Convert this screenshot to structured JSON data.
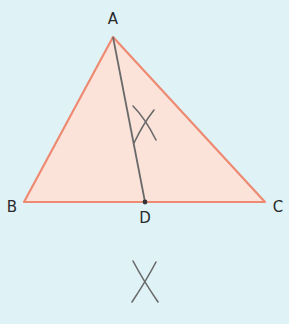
{
  "diagram": {
    "colors": {
      "background": "#dff3f7",
      "triangle_fill": "#fbe3da",
      "triangle_stroke": "#ee8a72",
      "construction": "#6a6a6a",
      "point": "#333333"
    },
    "points": {
      "A": {
        "label": "A",
        "x": 113,
        "y": 37
      },
      "B": {
        "label": "B",
        "x": 24,
        "y": 202
      },
      "C": {
        "label": "C",
        "x": 265,
        "y": 202
      },
      "D": {
        "label": "D",
        "x": 145,
        "y": 202
      }
    },
    "segments": [
      "AB",
      "BC",
      "CA",
      "AD"
    ],
    "construction_marks": [
      {
        "name": "arc-intersection-upper",
        "x": 143,
        "y": 125
      },
      {
        "name": "arc-intersection-lower",
        "x": 145,
        "y": 282
      }
    ]
  }
}
